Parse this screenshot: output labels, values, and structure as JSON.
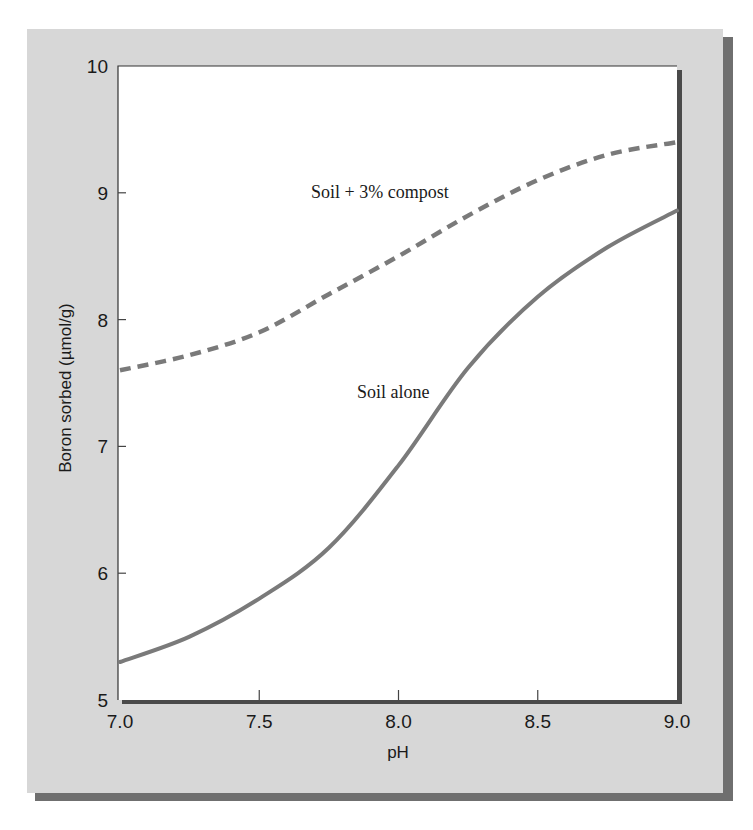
{
  "chart_data": {
    "type": "line",
    "title": "",
    "xlabel": "pH",
    "ylabel": "Boron sorbed (µmol/g)",
    "xlim": [
      7.0,
      9.0
    ],
    "ylim": [
      5,
      10
    ],
    "grid": false,
    "legend_position": "inline labels",
    "x_ticks": [
      "7.0",
      "7.5",
      "8.0",
      "8.5",
      "9.0"
    ],
    "y_ticks": [
      "5",
      "6",
      "7",
      "8",
      "9",
      "10"
    ],
    "x": [
      7.0,
      7.25,
      7.5,
      7.75,
      8.0,
      8.25,
      8.5,
      8.75,
      9.0
    ],
    "series": [
      {
        "name": "Soil + 3% compost",
        "style": "dashed",
        "color": "#7a7a7a",
        "values": [
          7.6,
          7.72,
          7.9,
          8.2,
          8.5,
          8.82,
          9.1,
          9.3,
          9.4
        ]
      },
      {
        "name": "Soil alone",
        "style": "solid",
        "color": "#7a7a7a",
        "values": [
          5.3,
          5.5,
          5.8,
          6.2,
          6.85,
          7.62,
          8.18,
          8.57,
          8.86
        ]
      }
    ],
    "annotations": [
      {
        "text": "Soil + 3% compost",
        "x": 7.68,
        "y": 9.0
      },
      {
        "text": "Soil alone",
        "x": 7.85,
        "y": 7.6
      }
    ]
  },
  "colors": {
    "panel": "#d7d7d7",
    "panel_shadow": "#6f6f6f",
    "plot_background": "#ffffff",
    "curve": "#7a7a7a"
  }
}
